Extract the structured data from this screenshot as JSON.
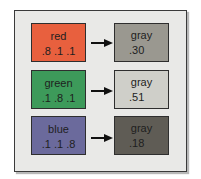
{
  "diagram": {
    "rows": [
      {
        "source": {
          "label": "red",
          "values": ".8 .1 .1",
          "color": "#e8603e"
        },
        "target": {
          "label": "gray",
          "values": ".30",
          "color": "#9a9890"
        }
      },
      {
        "source": {
          "label": "green",
          "values": ".1 .8 .1",
          "color": "#3d9a5a"
        },
        "target": {
          "label": "gray",
          "values": ".51",
          "color": "#cfcfc9"
        }
      },
      {
        "source": {
          "label": "blue",
          "values": ".1 .1 .8",
          "color": "#6b6a9c"
        },
        "target": {
          "label": "gray",
          "values": ".18",
          "color": "#5f5c55"
        }
      }
    ],
    "arrow_icon": "right-arrow-icon",
    "frame_color": "#e9e9e7"
  }
}
